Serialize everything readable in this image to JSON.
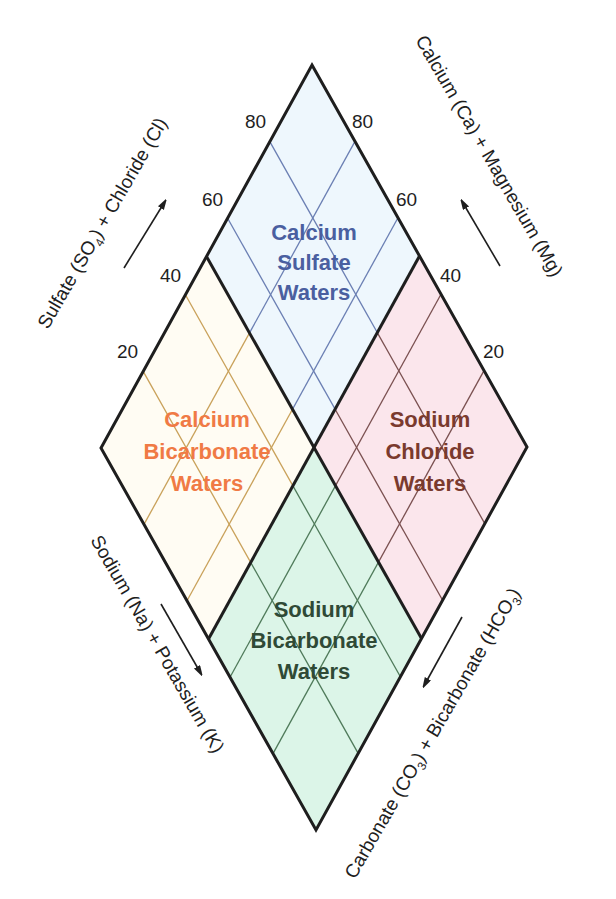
{
  "diagram": {
    "type": "piper-diamond",
    "regions": [
      {
        "id": "top",
        "line1": "Calcium",
        "line2": "Sulfate",
        "line3": "Waters",
        "fill": "#eef7fd",
        "text_color": "#4a5fa0",
        "grid_color": "#6b7fb3"
      },
      {
        "id": "left",
        "line1": "Calcium",
        "line2": "Bicarbonate",
        "line3": "Waters",
        "fill": "#fffcf3",
        "text_color": "#f07a45",
        "grid_color": "#c9a15a"
      },
      {
        "id": "right",
        "line1": "Sodium",
        "line2": "Chloride",
        "line3": "Waters",
        "fill": "#fbe6ec",
        "text_color": "#7a3a2e",
        "grid_color": "#7a5050"
      },
      {
        "id": "bottom",
        "line1": "Sodium",
        "line2": "Bicarbonate",
        "line3": "Waters",
        "fill": "#dcf5e8",
        "text_color": "#2f4a36",
        "grid_color": "#4f7a5a"
      }
    ],
    "ticks_left": [
      "80",
      "60",
      "40",
      "20"
    ],
    "ticks_right": [
      "80",
      "60",
      "40",
      "20"
    ],
    "axes": {
      "upper_left": {
        "text": "Sulfate (SO",
        "sub": "4",
        "text2": ") + Chloride (Cl)"
      },
      "upper_right": {
        "text": "Calcium (Ca) + Magnesium (Mg)"
      },
      "lower_left": {
        "text": "Sodium (Na) + Potassium (K)"
      },
      "lower_right": {
        "text": "Carbonate (CO",
        "sub": "3",
        "text2": ") + Bicarbonate (HCO",
        "sub2": "3",
        "text3": ")"
      }
    },
    "outline_color": "#1e1e1e"
  }
}
